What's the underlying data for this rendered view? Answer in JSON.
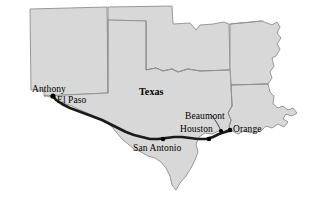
{
  "map": {
    "title": "Texas and surrounding states with Interstate 10 corridor route",
    "background_color": "#ffffff",
    "state_fill_color": "#d8d8d8",
    "state_border_color": "#8e8e8e",
    "route_color": "#1a1a1a",
    "city_dot_color": "#000000",
    "state_labels": [
      {
        "name": "Texas",
        "text": "Texas",
        "x": 139,
        "y": 87,
        "bold": true
      }
    ],
    "cities": [
      {
        "name": "anthony",
        "label": "Anthony",
        "dot_x": 53,
        "dot_y": 96,
        "label_x": 32,
        "label_y": 85,
        "has_leader": false
      },
      {
        "name": "el-paso",
        "label": "El Paso",
        "dot_x": 55,
        "dot_y": 99,
        "label_x": 57,
        "label_y": 96,
        "has_leader": false
      },
      {
        "name": "san-antonio",
        "label": "San Antonio",
        "dot_x": 163,
        "dot_y": 139,
        "label_x": 133,
        "label_y": 144,
        "has_leader": false
      },
      {
        "name": "houston",
        "label": "Houston",
        "dot_x": 209,
        "dot_y": 139,
        "label_x": 180,
        "label_y": 125,
        "has_leader": false
      },
      {
        "name": "beaumont",
        "label": "Beaumont",
        "dot_x": 222,
        "dot_y": 133,
        "label_x": 185,
        "label_y": 112,
        "has_leader": true
      },
      {
        "name": "orange",
        "label": "Orange",
        "dot_x": 230,
        "dot_y": 130,
        "label_x": 233,
        "label_y": 125,
        "has_leader": false
      }
    ],
    "route": {
      "name": "interstate-10",
      "from": "Anthony",
      "to": "Orange",
      "stroke_width": 2.6
    }
  }
}
